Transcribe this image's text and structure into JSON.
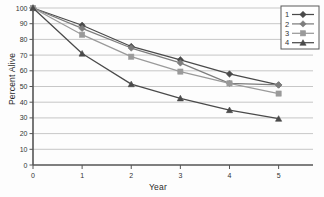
{
  "chart_data": {
    "type": "line",
    "title": "",
    "subtitle": "",
    "xlabel": "Year",
    "ylabel": "Percent Alive",
    "x": [
      0,
      1,
      2,
      3,
      4,
      5
    ],
    "xtick_labels": [
      "0",
      "1",
      "2",
      "3",
      "4",
      "5"
    ],
    "ytick_labels": [
      "0",
      "10",
      "20",
      "30",
      "40",
      "50",
      "60",
      "70",
      "80",
      "90",
      "100"
    ],
    "ytick_values": [
      0,
      10,
      20,
      30,
      40,
      50,
      60,
      70,
      80,
      90,
      100
    ],
    "xlim": [
      0,
      5.7
    ],
    "ylim": [
      0,
      100
    ],
    "grid": "horizontal",
    "legend_position": "top-right",
    "series": [
      {
        "name": "1",
        "marker": "diamond",
        "color": "#4a4a4a",
        "values": [
          100,
          89,
          75.5,
          67,
          58,
          51
        ]
      },
      {
        "name": "2",
        "marker": "diamond",
        "color": "#7d7d7d",
        "values": [
          100,
          87,
          74.5,
          65,
          52,
          51
        ]
      },
      {
        "name": "3",
        "marker": "square",
        "color": "#9a9a9a",
        "values": [
          100,
          83,
          69,
          59.5,
          52,
          45.5
        ]
      },
      {
        "name": "4",
        "marker": "triangle",
        "color": "#4a4a4a",
        "values": [
          100,
          71,
          51.5,
          42.5,
          35,
          29.5
        ]
      }
    ],
    "legend_entries": [
      {
        "label": "1",
        "marker": "diamond",
        "color": "#4a4a4a"
      },
      {
        "label": "2",
        "marker": "diamond",
        "color": "#7d7d7d"
      },
      {
        "label": "3",
        "marker": "square",
        "color": "#9a9a9a"
      },
      {
        "label": "4",
        "marker": "triangle",
        "color": "#4a4a4a"
      }
    ],
    "axis_color": "#555555",
    "grid_color": "#b9b9b9"
  }
}
